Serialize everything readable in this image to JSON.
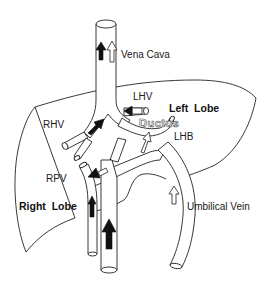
{
  "diagram": {
    "labels": {
      "vena_cava": "Vena Cava",
      "lhv": "LHV",
      "left_lobe": "Left  Lobe",
      "ductus": "Ductus",
      "rhv": "RHV",
      "lhb": "LHB",
      "rpv": "RPV",
      "right_lobe": "Right  Lobe",
      "umbilical_vein": "Umbilical Vein"
    },
    "colors": {
      "line": "#222222",
      "solid_arrow": "#111111",
      "open_arrow_fill": "#ffffff",
      "background": "#ffffff"
    },
    "legend_semantics": {
      "solid_arrow": "flow from portal / systemic venous return",
      "open_arrow": "flow from umbilical vein / ductus venosus"
    }
  }
}
